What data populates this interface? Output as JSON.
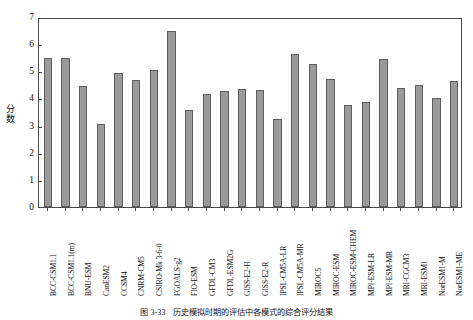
{
  "chart_data": {
    "type": "bar",
    "title": "",
    "subtitle": "",
    "xlabel": "",
    "ylabel": "分数",
    "ylim": [
      0,
      7
    ],
    "yticks": [
      0,
      1,
      2,
      3,
      4,
      5,
      6,
      7
    ],
    "grid": false,
    "legend": null,
    "bar_color": "#9a9a9a",
    "bar_edge_color": "#5d5d5d",
    "categories": [
      "BCC-CSM1.1",
      "BCC-CSM1.1(m)",
      "BNU-ESM",
      "CanESM2",
      "CCSM4",
      "CNRM-CM5",
      "CSIRO-Mk 3-6-0",
      "FGOALS-g2",
      "FIO-ESM",
      "GFDL-CM3",
      "GFDL-ESM2G",
      "GISS-E2-H",
      "GISS-E2-R",
      "IPSL-CM5A-LR",
      "IPSL-CM5A-MR",
      "MIROC5",
      "MIROC-ESM",
      "MIROC-ESM-CHEM",
      "MPI-ESM-LR",
      "MPI-ESM-MR",
      "MRI-CGCM3",
      "MRI-ESM1",
      "NorESM1-M",
      "NorESM1-ME"
    ],
    "values": [
      5.48,
      5.48,
      4.47,
      3.07,
      4.93,
      4.67,
      5.06,
      6.5,
      3.58,
      4.17,
      4.26,
      4.33,
      4.3,
      3.25,
      5.62,
      5.27,
      4.73,
      3.77,
      3.88,
      5.47,
      4.37,
      4.48,
      4.03,
      4.63
    ]
  },
  "caption": {
    "number": "图 3-33",
    "text": "历史模拟时期的评估中各模式的综合评分结果"
  }
}
